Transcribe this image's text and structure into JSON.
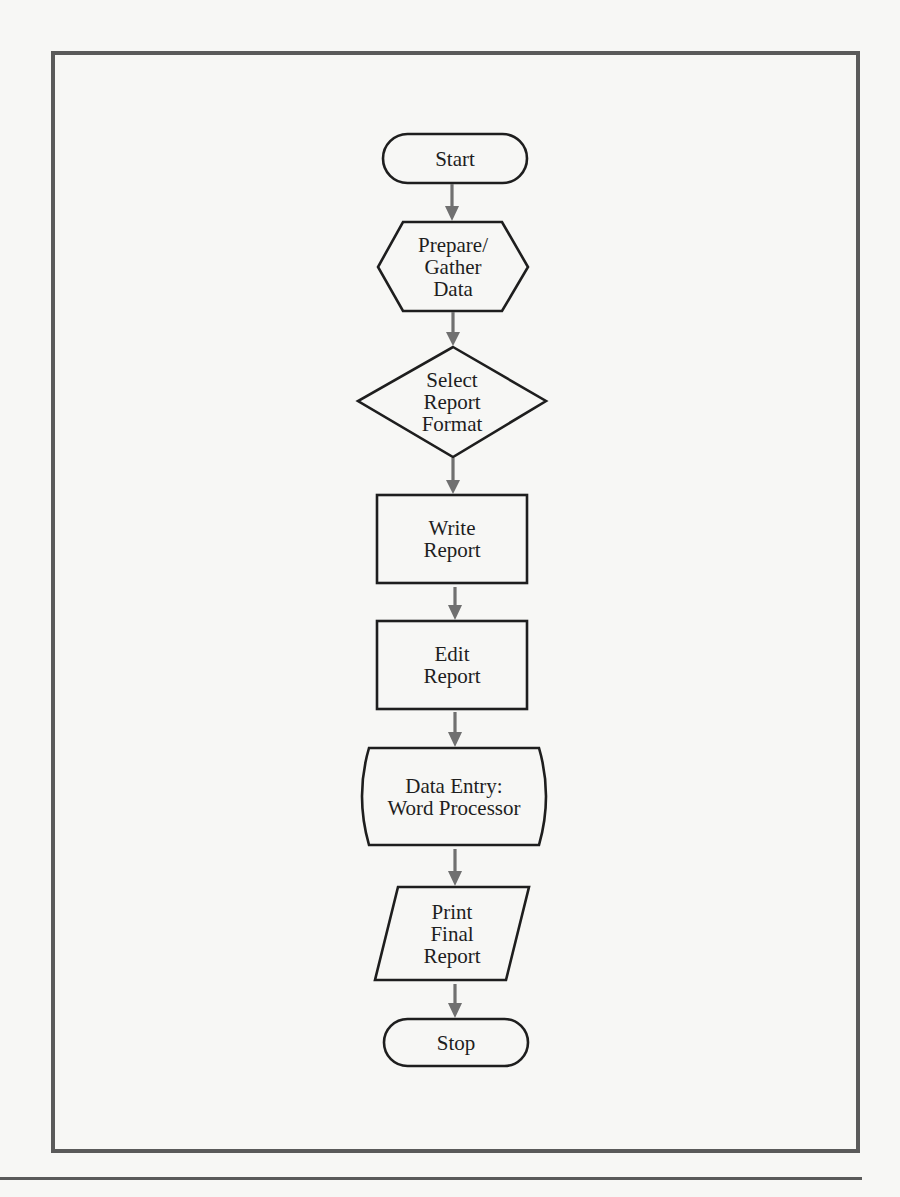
{
  "diagram": {
    "type": "flowchart",
    "nodes": [
      {
        "id": "start",
        "shape": "terminal",
        "lines": [
          "Start"
        ]
      },
      {
        "id": "prepare",
        "shape": "preparation-hexagon",
        "lines": [
          "Prepare/",
          "Gather",
          "Data"
        ]
      },
      {
        "id": "select",
        "shape": "decision-diamond",
        "lines": [
          "Select",
          "Report",
          "Format"
        ]
      },
      {
        "id": "write",
        "shape": "process-rectangle",
        "lines": [
          "Write",
          "Report"
        ]
      },
      {
        "id": "edit",
        "shape": "process-rectangle",
        "lines": [
          "Edit",
          "Report"
        ]
      },
      {
        "id": "entry",
        "shape": "online-storage",
        "lines": [
          "Data Entry:",
          "Word Processor"
        ]
      },
      {
        "id": "print",
        "shape": "input-output-parallelogram",
        "lines": [
          "Print",
          "Final",
          "Report"
        ]
      },
      {
        "id": "stop",
        "shape": "terminal",
        "lines": [
          "Stop"
        ]
      }
    ],
    "edges": [
      {
        "from": "start",
        "to": "prepare"
      },
      {
        "from": "prepare",
        "to": "select"
      },
      {
        "from": "select",
        "to": "write"
      },
      {
        "from": "write",
        "to": "edit"
      },
      {
        "from": "edit",
        "to": "entry"
      },
      {
        "from": "entry",
        "to": "print"
      },
      {
        "from": "print",
        "to": "stop"
      }
    ]
  },
  "colors": {
    "outline": "#1e1e1e",
    "arrow": "#707070",
    "frame": "#5a5a5a",
    "background": "#f7f7f5"
  }
}
